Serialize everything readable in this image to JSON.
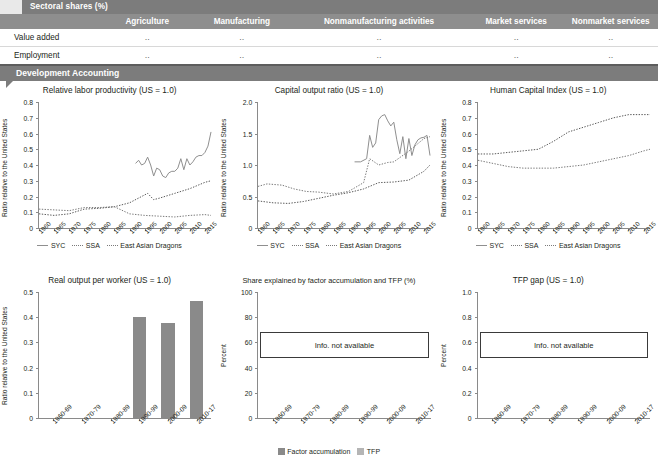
{
  "table": {
    "section_title": "Sectoral shares (%)",
    "columns": [
      "",
      "Agriculture",
      "Manufacturing",
      "Nonmanufacturing activities",
      "Market services",
      "Nonmarket services"
    ],
    "rows": [
      {
        "label": "Value added",
        "cells": [
          "..",
          "..",
          "..",
          "..",
          ".."
        ]
      },
      {
        "label": "Employment",
        "cells": [
          "..",
          "..",
          "..",
          "..",
          ".."
        ]
      }
    ],
    "section_title_2": "Development Accounting",
    "colors": {
      "band": "#7c7c7c",
      "colhead": "#8e8e8e",
      "text": "#ffffff"
    }
  },
  "chart_data": [
    {
      "id": "relative-labor-productivity",
      "type": "line",
      "title": "Relative labor productivity (US = 1.0)",
      "ylabel": "Ratio relative to the United States",
      "xlabel": "",
      "ylim": [
        0,
        0.8
      ],
      "yticks": [
        "0",
        "0.1",
        "0.2",
        "0.3",
        "0.4",
        "0.5",
        "0.6",
        "0.7",
        "0.8"
      ],
      "xticks": [
        "1960",
        "1965",
        "1970",
        "1975",
        "1980",
        "1985",
        "1990",
        "1995",
        "2000",
        "2005",
        "2010",
        "2015"
      ],
      "xlim": [
        1960,
        2017
      ],
      "legend": [
        "SYC",
        "SSA",
        "East Asian Dragons"
      ],
      "legend_position": "bottom",
      "grid": false,
      "series": [
        {
          "name": "SYC",
          "style": "solid",
          "color": "#8f8f8f",
          "x": [
            1992,
            1993,
            1994,
            1995,
            1996,
            1997,
            1998,
            1999,
            2000,
            2001,
            2002,
            2003,
            2004,
            2005,
            2006,
            2007,
            2008,
            2009,
            2010,
            2011,
            2012,
            2013,
            2014,
            2015,
            2016,
            2017
          ],
          "values": [
            0.41,
            0.43,
            0.4,
            0.41,
            0.45,
            0.4,
            0.33,
            0.38,
            0.37,
            0.33,
            0.32,
            0.35,
            0.36,
            0.36,
            0.38,
            0.44,
            0.37,
            0.44,
            0.4,
            0.42,
            0.45,
            0.46,
            0.46,
            0.48,
            0.52,
            0.61
          ]
        },
        {
          "name": "SSA",
          "style": "dotted",
          "color": "#7a7a7a",
          "x": [
            1960,
            1965,
            1970,
            1975,
            1980,
            1985,
            1990,
            1995,
            2000,
            2005,
            2010,
            2015,
            2017
          ],
          "values": [
            0.12,
            0.115,
            0.11,
            0.13,
            0.13,
            0.135,
            0.09,
            0.08,
            0.075,
            0.07,
            0.08,
            0.085,
            0.08
          ]
        },
        {
          "name": "East Asian Dragons",
          "style": "dotted",
          "color": "#5a5a5a",
          "x": [
            1960,
            1965,
            1970,
            1975,
            1980,
            1985,
            1990,
            1995,
            1996,
            1998,
            2000,
            2005,
            2010,
            2015,
            2017
          ],
          "values": [
            0.09,
            0.08,
            0.09,
            0.12,
            0.125,
            0.135,
            0.16,
            0.21,
            0.22,
            0.18,
            0.19,
            0.22,
            0.25,
            0.29,
            0.3
          ]
        }
      ]
    },
    {
      "id": "capital-output-ratio",
      "type": "line",
      "title": "Capital output ratio (US = 1.0)",
      "ylabel": "Ratio relative to the United States",
      "xlabel": "",
      "ylim": [
        0,
        2.0
      ],
      "yticks": [
        "0",
        "0.5",
        "1.0",
        "1.5",
        "2.0"
      ],
      "xticks": [
        "1960",
        "1965",
        "1970",
        "1975",
        "1980",
        "1985",
        "1990",
        "1995",
        "2000",
        "2005",
        "2010",
        "2015"
      ],
      "xlim": [
        1960,
        2017
      ],
      "legend": [
        "SYC",
        "SSA",
        "East Asian Dragons"
      ],
      "legend_position": "bottom",
      "grid": false,
      "series": [
        {
          "name": "SYC",
          "style": "solid",
          "color": "#8f8f8f",
          "x": [
            1992,
            1994,
            1996,
            1997,
            1998,
            1999,
            2000,
            2001,
            2002,
            2003,
            2004,
            2005,
            2006,
            2007,
            2008,
            2009,
            2010,
            2011,
            2012,
            2013,
            2014,
            2015,
            2016,
            2017
          ],
          "values": [
            1.05,
            1.05,
            1.1,
            1.47,
            1.28,
            1.35,
            1.72,
            1.78,
            1.8,
            1.7,
            1.62,
            1.68,
            1.4,
            1.18,
            1.45,
            1.1,
            1.42,
            1.15,
            1.32,
            1.4,
            1.43,
            1.44,
            1.47,
            1.15
          ]
        },
        {
          "name": "SSA",
          "style": "dotted",
          "color": "#7a7a7a",
          "x": [
            1960,
            1963,
            1968,
            1972,
            1976,
            1980,
            1985,
            1990,
            1995,
            1997,
            2000,
            2003,
            2005,
            2010,
            2015,
            2017
          ],
          "values": [
            0.66,
            0.7,
            0.68,
            0.62,
            0.58,
            0.57,
            0.54,
            0.58,
            0.72,
            1.1,
            1.0,
            1.04,
            1.05,
            1.22,
            1.42,
            1.45
          ]
        },
        {
          "name": "East Asian Dragons",
          "style": "dotted",
          "color": "#5a5a5a",
          "x": [
            1960,
            1965,
            1970,
            1975,
            1980,
            1985,
            1990,
            1995,
            2000,
            2005,
            2010,
            2015,
            2017
          ],
          "values": [
            0.43,
            0.4,
            0.39,
            0.42,
            0.47,
            0.52,
            0.56,
            0.62,
            0.72,
            0.73,
            0.76,
            0.9,
            1.0
          ]
        }
      ]
    },
    {
      "id": "human-capital-index",
      "type": "line",
      "title": "Human Capital Index (US = 1.0)",
      "ylabel": "Ratio relative to the United States",
      "xlabel": "",
      "ylim": [
        0,
        0.8
      ],
      "yticks": [
        "0",
        "0.1",
        "0.2",
        "0.3",
        "0.4",
        "0.5",
        "0.6",
        "0.7",
        "0.8"
      ],
      "xticks": [
        "1960",
        "1965",
        "1970",
        "1975",
        "1980",
        "1985",
        "1990",
        "1995",
        "2000",
        "2005",
        "2010",
        "2015"
      ],
      "xlim": [
        1960,
        2017
      ],
      "legend": [
        "SYC",
        "SSA",
        "East Asian Dragons"
      ],
      "legend_position": "bottom",
      "grid": false,
      "series": [
        {
          "name": "East Asian Dragons",
          "style": "dotted",
          "color": "#5a5a5a",
          "x": [
            1960,
            1965,
            1970,
            1975,
            1980,
            1985,
            1990,
            1995,
            2000,
            2005,
            2010,
            2015,
            2017
          ],
          "values": [
            0.47,
            0.47,
            0.48,
            0.49,
            0.5,
            0.55,
            0.61,
            0.64,
            0.67,
            0.7,
            0.72,
            0.72,
            0.72
          ]
        },
        {
          "name": "SSA",
          "style": "dotted",
          "color": "#7a7a7a",
          "x": [
            1960,
            1965,
            1970,
            1975,
            1980,
            1985,
            1990,
            1995,
            2000,
            2005,
            2010,
            2015,
            2017
          ],
          "values": [
            0.43,
            0.41,
            0.39,
            0.38,
            0.38,
            0.38,
            0.39,
            0.4,
            0.42,
            0.44,
            0.46,
            0.49,
            0.5
          ]
        }
      ]
    },
    {
      "id": "real-output-per-worker",
      "type": "bar",
      "title": "Real output per worker (US = 1.0)",
      "ylabel": "Ratio relative to the United States",
      "xlabel": "",
      "ylim": [
        0,
        0.5
      ],
      "yticks": [
        "0",
        "0.1",
        "0.2",
        "0.3",
        "0.4",
        "0.5"
      ],
      "categories": [
        "1960-69",
        "1970-79",
        "1980-89",
        "1990-99",
        "2000-09",
        "2010-17"
      ],
      "values": [
        null,
        null,
        null,
        0.402,
        0.376,
        0.463
      ],
      "bar_color": "#8a8a8a",
      "grid": false
    },
    {
      "id": "share-factor-accumulation-tfp",
      "type": "bar",
      "title": "Share explained by factor accumulation and TFP (%)",
      "ylabel": "Percent",
      "xlabel": "",
      "ylim": [
        0,
        100
      ],
      "yticks": [
        "0",
        "20",
        "40",
        "60",
        "80",
        "100"
      ],
      "categories": [
        "1960-69",
        "1970-79",
        "1980-89",
        "1990-99",
        "2000-09",
        "2010-17"
      ],
      "values": [],
      "annotation": "Info. not available",
      "legend": [
        "Factor accumulation",
        "TFP"
      ],
      "legend_colors": [
        "#8a8a8a",
        "#b5b5b5"
      ],
      "legend_position": "bottom",
      "grid": false
    },
    {
      "id": "tfp-gap",
      "type": "bar",
      "title": "TFP gap (US = 1.0)",
      "ylabel": "Percent",
      "xlabel": "",
      "ylim": [
        0,
        1.0
      ],
      "yticks": [
        "0",
        "0.2",
        "0.4",
        "0.6",
        "0.8",
        "1.0"
      ],
      "categories": [
        "1960-69",
        "1970-79",
        "1980-89",
        "1990-99",
        "2000-09",
        "2010-17"
      ],
      "values": [],
      "annotation": "Info. not available",
      "grid": false
    }
  ]
}
